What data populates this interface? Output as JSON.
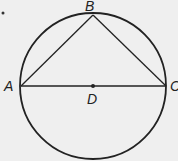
{
  "diagram": {
    "type": "circle-inscribed-triangle",
    "circle": {
      "center": "D",
      "cx": 93,
      "cy": 86,
      "r": 73
    },
    "points": [
      {
        "label": "A",
        "x": 21,
        "y": 86
      },
      {
        "label": "B",
        "x": 93,
        "y": 15
      },
      {
        "label": "C",
        "x": 166,
        "y": 86
      },
      {
        "label": "D",
        "x": 93,
        "y": 86
      }
    ],
    "segments": [
      [
        "A",
        "B"
      ],
      [
        "B",
        "C"
      ],
      [
        "A",
        "C"
      ]
    ],
    "labels": {
      "A": "A",
      "B": "B",
      "C": "C",
      "D": "D"
    },
    "line_color": "#222222"
  }
}
